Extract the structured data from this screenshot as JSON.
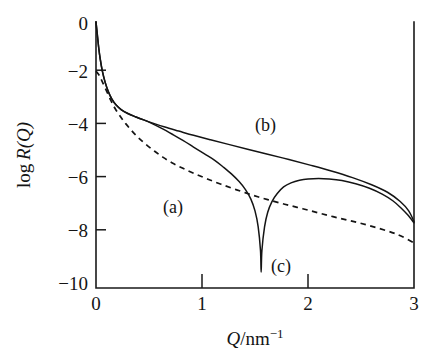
{
  "chart_data": {
    "type": "line",
    "title": "",
    "xlabel": "Q/nm^-1",
    "xlabel_parts": {
      "symbol": "Q",
      "separator": "/",
      "unit": "nm",
      "exponent": "−1"
    },
    "ylabel": "log R(Q)",
    "ylabel_parts": {
      "prefix": "log ",
      "symbol": "R",
      "argument": "(Q)"
    },
    "xlim": [
      0,
      3
    ],
    "ylim": [
      -10,
      0
    ],
    "xticks": [
      0,
      1,
      2,
      3
    ],
    "xticklabels": [
      "0",
      "1",
      "2",
      "3"
    ],
    "yticks": [
      0,
      -2,
      -4,
      -6,
      -8,
      -10
    ],
    "yticklabels": [
      "0",
      "−2",
      "−4",
      "−6",
      "−8",
      "−10"
    ],
    "grid": false,
    "legend_position": "inline-annotations",
    "tick_direction": "in",
    "annotations": [
      {
        "text": "(a)",
        "x": 0.63,
        "y": -6.6,
        "curve": "a"
      },
      {
        "text": "(b)",
        "x": 1.56,
        "y": -4.1,
        "curve": "b"
      },
      {
        "text": "(c)",
        "x": 1.75,
        "y": -9.1,
        "curve": "c"
      }
    ],
    "series": [
      {
        "name": "(a)",
        "style": "dashed",
        "color": "#141414",
        "points": [
          [
            0.0,
            -1.85
          ],
          [
            0.03,
            -2.0
          ],
          [
            0.06,
            -2.25
          ],
          [
            0.1,
            -2.6
          ],
          [
            0.14,
            -2.95
          ],
          [
            0.18,
            -3.25
          ],
          [
            0.23,
            -3.55
          ],
          [
            0.28,
            -3.82
          ],
          [
            0.34,
            -4.1
          ],
          [
            0.4,
            -4.35
          ],
          [
            0.47,
            -4.6
          ],
          [
            0.55,
            -4.85
          ],
          [
            0.63,
            -5.08
          ],
          [
            0.72,
            -5.3
          ],
          [
            0.82,
            -5.5
          ],
          [
            0.93,
            -5.7
          ],
          [
            1.05,
            -5.9
          ],
          [
            1.18,
            -6.1
          ],
          [
            1.32,
            -6.3
          ],
          [
            1.47,
            -6.5
          ],
          [
            1.62,
            -6.68
          ],
          [
            1.78,
            -6.85
          ],
          [
            1.95,
            -7.02
          ],
          [
            2.12,
            -7.2
          ],
          [
            2.3,
            -7.38
          ],
          [
            2.48,
            -7.55
          ],
          [
            2.66,
            -7.75
          ],
          [
            2.84,
            -7.98
          ],
          [
            3.0,
            -8.3
          ]
        ]
      },
      {
        "name": "(b)",
        "style": "solid",
        "color": "#141414",
        "points": [
          [
            0.0,
            0.0
          ],
          [
            0.012,
            -0.45
          ],
          [
            0.025,
            -0.95
          ],
          [
            0.04,
            -1.4
          ],
          [
            0.06,
            -1.85
          ],
          [
            0.085,
            -2.25
          ],
          [
            0.115,
            -2.6
          ],
          [
            0.15,
            -2.9
          ],
          [
            0.19,
            -3.12
          ],
          [
            0.24,
            -3.3
          ],
          [
            0.3,
            -3.44
          ],
          [
            0.37,
            -3.56
          ],
          [
            0.45,
            -3.68
          ],
          [
            0.55,
            -3.82
          ],
          [
            0.65,
            -3.95
          ],
          [
            0.78,
            -4.1
          ],
          [
            0.92,
            -4.26
          ],
          [
            1.08,
            -4.43
          ],
          [
            1.25,
            -4.6
          ],
          [
            1.43,
            -4.78
          ],
          [
            1.62,
            -4.97
          ],
          [
            1.82,
            -5.17
          ],
          [
            2.02,
            -5.38
          ],
          [
            2.22,
            -5.6
          ],
          [
            2.42,
            -5.85
          ],
          [
            2.6,
            -6.12
          ],
          [
            2.75,
            -6.4
          ],
          [
            2.87,
            -6.75
          ],
          [
            2.95,
            -7.1
          ],
          [
            3.0,
            -7.5
          ]
        ]
      },
      {
        "name": "(c)",
        "style": "solid",
        "color": "#141414",
        "points": [
          [
            0.0,
            0.0
          ],
          [
            0.012,
            -0.45
          ],
          [
            0.025,
            -0.95
          ],
          [
            0.04,
            -1.4
          ],
          [
            0.06,
            -1.85
          ],
          [
            0.085,
            -2.25
          ],
          [
            0.115,
            -2.6
          ],
          [
            0.15,
            -2.9
          ],
          [
            0.19,
            -3.12
          ],
          [
            0.24,
            -3.3
          ],
          [
            0.3,
            -3.44
          ],
          [
            0.37,
            -3.56
          ],
          [
            0.45,
            -3.68
          ],
          [
            0.53,
            -3.82
          ],
          [
            0.62,
            -4.0
          ],
          [
            0.72,
            -4.22
          ],
          [
            0.82,
            -4.45
          ],
          [
            0.92,
            -4.7
          ],
          [
            1.02,
            -4.95
          ],
          [
            1.12,
            -5.2
          ],
          [
            1.2,
            -5.45
          ],
          [
            1.28,
            -5.72
          ],
          [
            1.35,
            -6.0
          ],
          [
            1.41,
            -6.3
          ],
          [
            1.46,
            -6.65
          ],
          [
            1.5,
            -7.1
          ],
          [
            1.53,
            -7.7
          ],
          [
            1.552,
            -8.6
          ],
          [
            1.558,
            -9.4
          ],
          [
            1.565,
            -8.6
          ],
          [
            1.59,
            -7.7
          ],
          [
            1.62,
            -7.15
          ],
          [
            1.66,
            -6.75
          ],
          [
            1.71,
            -6.45
          ],
          [
            1.77,
            -6.2
          ],
          [
            1.84,
            -6.05
          ],
          [
            1.92,
            -5.95
          ],
          [
            2.0,
            -5.9
          ],
          [
            2.1,
            -5.88
          ],
          [
            2.2,
            -5.9
          ],
          [
            2.32,
            -5.96
          ],
          [
            2.45,
            -6.08
          ],
          [
            2.58,
            -6.25
          ],
          [
            2.7,
            -6.47
          ],
          [
            2.8,
            -6.72
          ],
          [
            2.88,
            -7.0
          ],
          [
            2.94,
            -7.25
          ],
          [
            3.0,
            -7.55
          ]
        ]
      }
    ]
  },
  "axes": {
    "x_label_symbol": "Q",
    "x_label_rest": "/nm",
    "x_label_exponent": "−1",
    "y_label_log": "log ",
    "y_label_symbol": "R",
    "y_label_arg": "(Q)"
  }
}
